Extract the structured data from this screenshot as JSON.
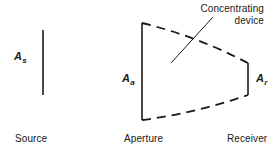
{
  "figure": {
    "type": "optical-concentrator-geometry-diagram",
    "background_color": "#ffffff",
    "stroke_color": "#1a1a1a",
    "text_color": "#1a1a1a",
    "width": 276,
    "height": 155
  },
  "labels": {
    "source_area_symbol": "A",
    "source_area_subscript": "s",
    "aperture_area_symbol": "A",
    "aperture_area_subscript": "a",
    "receiver_area_symbol": "A",
    "receiver_area_subscript": "r"
  },
  "captions": {
    "source": "Source",
    "aperture": "Aperture",
    "receiver": "Receiver"
  },
  "annotation": {
    "line1": "Concentrating",
    "line2": "device"
  },
  "geometry": {
    "source_line": {
      "x": 43,
      "y1": 30,
      "y2": 95,
      "style": "solid"
    },
    "aperture_line": {
      "x": 142,
      "y1": 23,
      "y2": 120,
      "style": "solid"
    },
    "receiver_line": {
      "x": 248,
      "y1": 63,
      "y2": 95,
      "style": "solid"
    },
    "top_wall": {
      "from_x": 142,
      "from_y": 23,
      "to_x": 248,
      "to_y": 63,
      "style": "dashed"
    },
    "bottom_wall": {
      "from_x": 142,
      "from_y": 120,
      "to_x": 248,
      "to_y": 95,
      "style": "dashed"
    },
    "leader_line": {
      "from_x": 213,
      "from_y": 17,
      "to_x": 171,
      "to_y": 63,
      "style": "solid"
    }
  }
}
